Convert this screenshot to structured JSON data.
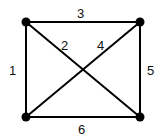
{
  "graph": {
    "nodes": [
      {
        "id": "A",
        "x": 26,
        "y": 22
      },
      {
        "id": "B",
        "x": 140,
        "y": 22
      },
      {
        "id": "C",
        "x": 26,
        "y": 117
      },
      {
        "id": "D",
        "x": 140,
        "y": 117
      }
    ],
    "edges": [
      {
        "from": "A",
        "to": "C",
        "label": "1"
      },
      {
        "from": "A",
        "to": "D",
        "label": "2"
      },
      {
        "from": "A",
        "to": "B",
        "label": "3"
      },
      {
        "from": "C",
        "to": "B",
        "label": "4"
      },
      {
        "from": "B",
        "to": "D",
        "label": "5"
      },
      {
        "from": "C",
        "to": "D",
        "label": "6"
      }
    ]
  },
  "labels": {
    "e1": "1",
    "e2": "2",
    "e3": "3",
    "e4": "4",
    "e5": "5",
    "e6": "6"
  }
}
